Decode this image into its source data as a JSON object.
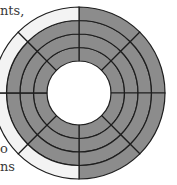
{
  "text_fragments": {
    "top": "nts,",
    "middle": "o",
    "bottom": "ns"
  },
  "diagram": {
    "type": "concentric-ring-sectors",
    "center": [
      79,
      93
    ],
    "inner_radius": 32,
    "ring_radii": [
      32,
      45.5,
      59,
      72.5,
      86
    ],
    "rings": 4,
    "sectors": 8,
    "colors": {
      "filled": "#8c8c8c",
      "empty": "#f3f3f3",
      "stroke": "#1e1e1e"
    },
    "outer_ring_state": [
      "filled",
      "filled",
      "filled",
      "filled",
      "empty",
      "empty",
      "empty",
      "empty"
    ],
    "inner_rings_state": "all-filled"
  }
}
